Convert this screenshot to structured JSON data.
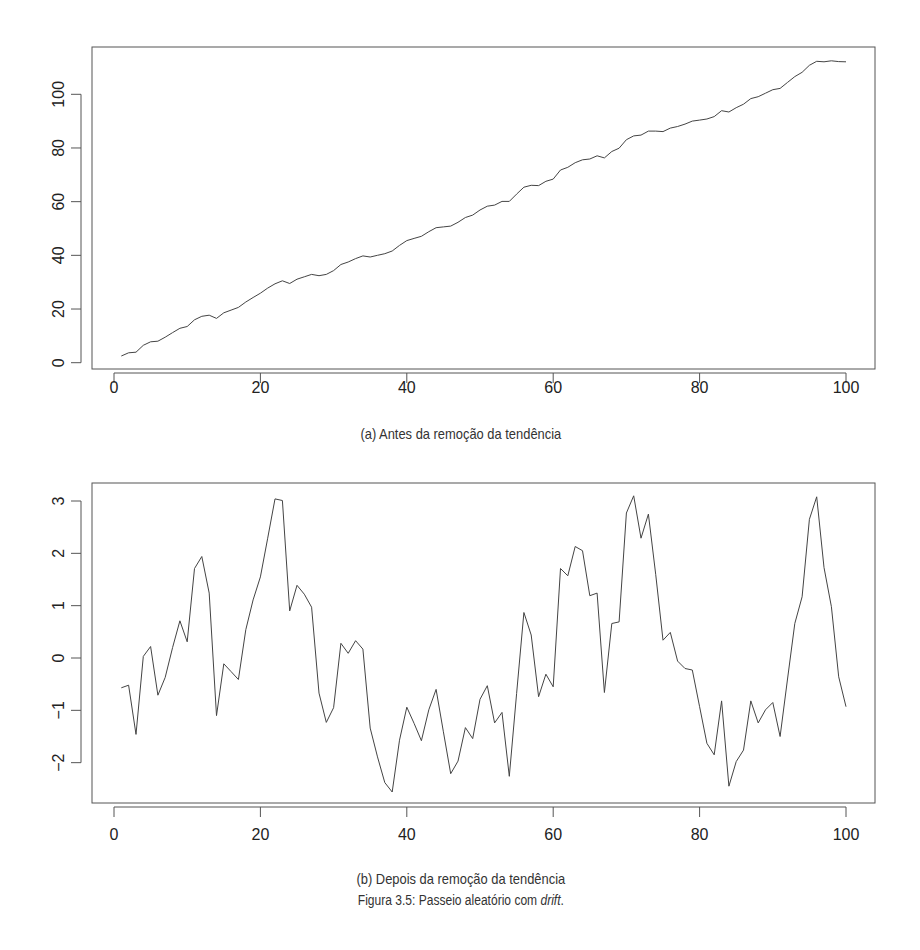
{
  "figure": {
    "caption_prefix": "Figura 3.5: Passeio aleatório com ",
    "caption_italic": "drift",
    "caption_suffix": ".",
    "line_color": "#444444",
    "axis_color": "#555555"
  },
  "chart_data": [
    {
      "type": "line",
      "title": "",
      "caption": "(a) Antes da remoção da tendência",
      "xlabel": "",
      "ylabel": "",
      "xlim": [
        -2,
        104
      ],
      "ylim": [
        -2,
        117
      ],
      "x_ticks": [
        0,
        20,
        40,
        60,
        80,
        100
      ],
      "y_ticks": [
        0,
        20,
        40,
        60,
        80,
        100
      ],
      "grid": false,
      "legend": null,
      "x": [
        1,
        2,
        3,
        4,
        5,
        6,
        7,
        8,
        9,
        10,
        11,
        12,
        13,
        14,
        15,
        16,
        17,
        18,
        19,
        20,
        21,
        22,
        23,
        24,
        25,
        26,
        27,
        28,
        29,
        30,
        31,
        32,
        33,
        34,
        35,
        36,
        37,
        38,
        39,
        40,
        41,
        42,
        43,
        44,
        45,
        46,
        47,
        48,
        49,
        50,
        51,
        52,
        53,
        54,
        55,
        56,
        57,
        58,
        59,
        60,
        61,
        62,
        63,
        64,
        65,
        66,
        67,
        68,
        69,
        70,
        71,
        72,
        73,
        74,
        75,
        76,
        77,
        78,
        79,
        80,
        81,
        82,
        83,
        84,
        85,
        86,
        87,
        88,
        89,
        90,
        91,
        92,
        93,
        94,
        95,
        96,
        97,
        98,
        99,
        100
      ],
      "values": [
        2.5,
        3.7,
        3.9,
        6.5,
        7.8,
        8.0,
        9.5,
        11.2,
        12.8,
        13.5,
        16.0,
        17.3,
        17.7,
        16.5,
        18.6,
        19.6,
        20.6,
        22.6,
        24.3,
        25.9,
        27.8,
        29.4,
        30.5,
        29.5,
        31.1,
        32.0,
        32.9,
        32.4,
        32.9,
        34.3,
        36.6,
        37.5,
        38.8,
        39.8,
        39.4,
        40.0,
        40.6,
        41.6,
        43.7,
        45.5,
        46.3,
        47.1,
        48.8,
        50.3,
        50.6,
        50.9,
        52.3,
        54.1,
        55.0,
        56.9,
        58.3,
        58.7,
        60.1,
        60.1,
        62.8,
        65.4,
        66.1,
        66.0,
        67.6,
        68.4,
        71.8,
        72.8,
        74.5,
        75.6,
        75.9,
        77.1,
        76.3,
        78.7,
        79.9,
        83.1,
        84.5,
        84.8,
        86.3,
        86.3,
        86.1,
        87.4,
        88.0,
        88.9,
        90.0,
        90.4,
        90.8,
        91.7,
        93.9,
        93.4,
        95.0,
        96.3,
        98.4,
        99.1,
        100.4,
        101.7,
        102.2,
        104.4,
        106.6,
        108.2,
        110.8,
        112.3,
        112.1,
        112.5,
        112.2,
        112.1
      ]
    },
    {
      "type": "line",
      "title": "",
      "caption": "(b) Depois da remoção da tendência",
      "xlabel": "",
      "ylabel": "",
      "xlim": [
        -2,
        104
      ],
      "ylim": [
        -2.9,
        3.35
      ],
      "x_ticks": [
        0,
        20,
        40,
        60,
        80,
        100
      ],
      "y_ticks": [
        -2,
        -1,
        0,
        1,
        2,
        3
      ],
      "grid": false,
      "legend": null,
      "x": [
        1,
        2,
        3,
        4,
        5,
        6,
        7,
        8,
        9,
        10,
        11,
        12,
        13,
        14,
        15,
        16,
        17,
        18,
        19,
        20,
        21,
        22,
        23,
        24,
        25,
        26,
        27,
        28,
        29,
        30,
        31,
        32,
        33,
        34,
        35,
        36,
        37,
        38,
        39,
        40,
        41,
        42,
        43,
        44,
        45,
        46,
        47,
        48,
        49,
        50,
        51,
        52,
        53,
        54,
        55,
        56,
        57,
        58,
        59,
        60,
        61,
        62,
        63,
        64,
        65,
        66,
        67,
        68,
        69,
        70,
        71,
        72,
        73,
        74,
        75,
        76,
        77,
        78,
        79,
        80,
        81,
        82,
        83,
        84,
        85,
        86,
        87,
        88,
        89,
        90,
        91,
        92,
        93,
        94,
        95,
        96,
        97,
        98,
        99,
        100
      ],
      "values": [
        -0.57,
        -0.52,
        -1.46,
        0.03,
        0.22,
        -0.71,
        -0.37,
        0.2,
        0.71,
        0.31,
        1.71,
        1.94,
        1.24,
        -1.1,
        -0.11,
        -0.26,
        -0.41,
        0.54,
        1.11,
        1.55,
        2.29,
        3.04,
        3.01,
        0.9,
        1.39,
        1.22,
        0.97,
        -0.67,
        -1.23,
        -0.95,
        0.28,
        0.09,
        0.33,
        0.17,
        -1.34,
        -1.89,
        -2.38,
        -2.56,
        -1.57,
        -0.94,
        -1.25,
        -1.58,
        -0.99,
        -0.6,
        -1.41,
        -2.21,
        -1.97,
        -1.33,
        -1.54,
        -0.79,
        -0.53,
        -1.24,
        -1.04,
        -2.26,
        -0.68,
        0.87,
        0.44,
        -0.74,
        -0.31,
        -0.55,
        1.71,
        1.57,
        2.13,
        2.05,
        1.19,
        1.24,
        -0.66,
        0.66,
        0.69,
        2.77,
        3.1,
        2.29,
        2.75,
        1.6,
        0.34,
        0.49,
        -0.06,
        -0.2,
        -0.23,
        -0.93,
        -1.63,
        -1.85,
        -0.82,
        -2.45,
        -1.98,
        -1.76,
        -0.82,
        -1.24,
        -0.99,
        -0.85,
        -1.5,
        -0.42,
        0.66,
        1.17,
        2.65,
        3.08,
        1.73,
        0.98,
        -0.36,
        -0.93
      ]
    }
  ]
}
